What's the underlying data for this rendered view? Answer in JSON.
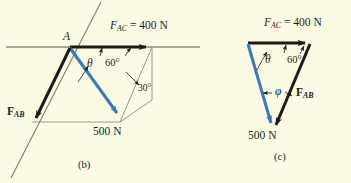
{
  "figure": {
    "background_color": "#fbfbe4",
    "ink_color": "#1b1b18",
    "vector_blue": "#3b7ab4",
    "construction_gray": "#8c8c7a"
  },
  "panels": [
    {
      "id": "b",
      "caption": "(b)",
      "point_label": "A",
      "labels": {
        "f_ac_name": "F",
        "f_ac_sub": "AC",
        "f_ac_value": " = 400 N",
        "f_ab_name": "F",
        "f_ab_sub": "AB",
        "weight": "500 N",
        "theta": "θ",
        "angle_60": "60°",
        "angle_30": "30°"
      }
    },
    {
      "id": "c",
      "caption": "(c)",
      "labels": {
        "f_ac_name": "F",
        "f_ac_sub": "AC",
        "f_ac_value": " = 400 N",
        "f_ab_name": "F",
        "f_ab_sub": "AB",
        "weight": "500 N",
        "theta": "θ",
        "phi": "φ",
        "angle_60": "60°"
      }
    }
  ]
}
